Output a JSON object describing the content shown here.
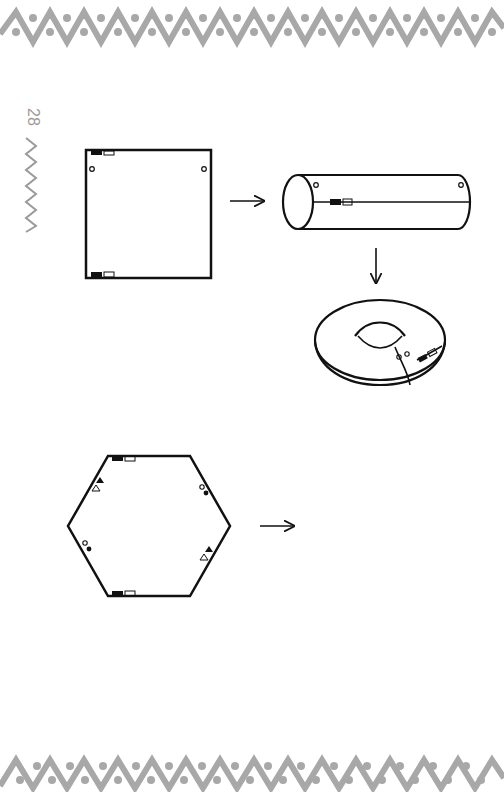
{
  "page": {
    "page_number": "28",
    "border_color": "#a8a8a8",
    "line_color": "#111111",
    "background": "#ffffff"
  },
  "figures": [
    {
      "id": "square-sheet",
      "label": "square fabric with tabs and snap dots"
    },
    {
      "id": "cylinder",
      "label": "rolled into tube"
    },
    {
      "id": "torus",
      "label": "bent into ring / donut"
    },
    {
      "id": "hexagon-sheet",
      "label": "hexagon with tabs, circles and triangles"
    }
  ],
  "arrows": [
    {
      "id": "arrow-square-to-cylinder",
      "direction": "right"
    },
    {
      "id": "arrow-cylinder-to-torus",
      "direction": "down"
    },
    {
      "id": "arrow-hexagon-to-result",
      "direction": "right"
    }
  ]
}
